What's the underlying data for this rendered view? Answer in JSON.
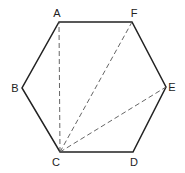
{
  "diagram": {
    "type": "regular-hexagon",
    "colors": {
      "stroke": "#222222",
      "dashed": "#555555",
      "label": "#222222",
      "background": "#ffffff"
    },
    "vertices": [
      {
        "name": "A",
        "label": "A",
        "x": 59,
        "y": 22,
        "lx": 57,
        "ly": 17
      },
      {
        "name": "F",
        "label": "F",
        "x": 132,
        "y": 22,
        "lx": 134,
        "ly": 17
      },
      {
        "name": "E",
        "label": "E",
        "x": 166,
        "y": 87,
        "lx": 172,
        "ly": 91
      },
      {
        "name": "D",
        "label": "D",
        "x": 133,
        "y": 152,
        "lx": 134,
        "ly": 166
      },
      {
        "name": "C",
        "label": "C",
        "x": 60,
        "y": 152,
        "lx": 56,
        "ly": 166
      },
      {
        "name": "B",
        "label": "B",
        "x": 22,
        "y": 88,
        "lx": 15,
        "ly": 92
      }
    ],
    "sides": [
      "AF",
      "FE",
      "ED",
      "DC",
      "CB",
      "BA"
    ],
    "diagonals": [
      {
        "from": "C",
        "to": "A",
        "style": "dashed"
      },
      {
        "from": "C",
        "to": "F",
        "style": "dashed"
      },
      {
        "from": "C",
        "to": "E",
        "style": "dashed"
      }
    ]
  }
}
